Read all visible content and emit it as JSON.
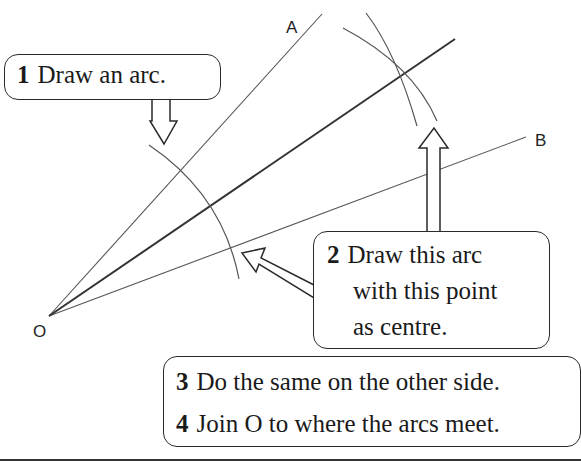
{
  "diagram": {
    "points": {
      "O": {
        "label": "O",
        "x": 49,
        "y": 316
      },
      "A": {
        "label": "A",
        "x": 322,
        "y": 14
      },
      "B": {
        "label": "B",
        "x": 526,
        "y": 137
      },
      "arcs_meet": {
        "x": 402,
        "y": 73
      }
    },
    "labels": {
      "O": "O",
      "A": "A",
      "B": "B"
    },
    "steps": [
      {
        "number": "1",
        "text": "Draw an arc."
      },
      {
        "number": "2",
        "lines": [
          "Draw this arc",
          "with this point",
          "as centre."
        ]
      },
      {
        "number": "3",
        "text": "Do the same on the other side."
      },
      {
        "number": "4",
        "text": "Join O to where the arcs meet."
      }
    ],
    "colors": {
      "line": "#444444",
      "bisector": "#333333",
      "border": "#2a2a2a",
      "background": "#ffffff"
    }
  }
}
